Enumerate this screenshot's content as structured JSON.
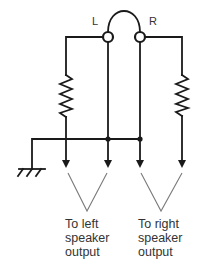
{
  "diagram": {
    "type": "headphone-to-speaker-output wiring schematic",
    "terminals": {
      "left_label": "L",
      "right_label": "R"
    },
    "components": [
      {
        "id": "resistor-left",
        "type": "resistor"
      },
      {
        "id": "resistor-right",
        "type": "resistor"
      },
      {
        "id": "ground",
        "type": "ground-symbol"
      },
      {
        "id": "jumper",
        "type": "arc-jumper between L and R terminals"
      }
    ],
    "outputs": {
      "left": {
        "line1": "To left",
        "line2": "speaker",
        "line3": "output"
      },
      "right": {
        "line1": "To right",
        "line2": "speaker",
        "line3": "output"
      }
    },
    "colors": {
      "wire": "#1a1a1a",
      "bracket": "#7a7a7a",
      "text": "#333333",
      "background": "#ffffff"
    }
  }
}
